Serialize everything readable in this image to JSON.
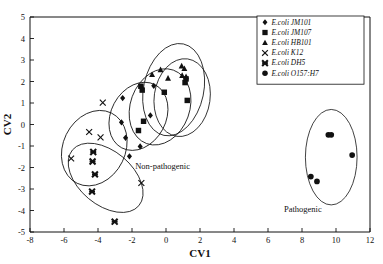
{
  "chart_data": {
    "type": "scatter",
    "title": "",
    "xlabel": "CV1",
    "ylabel": "CV2",
    "xlim": [
      -8,
      12
    ],
    "ylim": [
      -5,
      5
    ],
    "xticks": [
      -8,
      -6,
      -4,
      -2,
      0,
      2,
      4,
      6,
      8,
      10,
      12
    ],
    "yticks": [
      -5,
      -4,
      -3,
      -2,
      -1,
      0,
      1,
      2,
      3,
      4,
      5
    ],
    "grid": false,
    "legend_position": "top-right",
    "annotations": [
      {
        "text": "Non-pathogenic",
        "x": -0.2,
        "y": -2.05
      },
      {
        "text": "Pathogenic",
        "x": 8.05,
        "y": -4.05
      }
    ],
    "series": [
      {
        "name": "E.coli JM101",
        "marker": "diamond",
        "points": [
          {
            "x": -2.55,
            "y": 1.23
          },
          {
            "x": -2.62,
            "y": 0.1
          },
          {
            "x": -2.38,
            "y": -0.62
          },
          {
            "x": -2.15,
            "y": -1.48
          },
          {
            "x": -1.52,
            "y": -1.02
          },
          {
            "x": -0.92,
            "y": 0.42
          },
          {
            "x": -0.72,
            "y": 1.8
          }
        ]
      },
      {
        "name": "E.coli JM107",
        "marker": "square",
        "points": [
          {
            "x": -1.48,
            "y": 1.78
          },
          {
            "x": -1.4,
            "y": 1.6
          },
          {
            "x": -1.32,
            "y": 0.15
          },
          {
            "x": -1.62,
            "y": -0.28
          },
          {
            "x": -0.1,
            "y": 1.5
          },
          {
            "x": 1.12,
            "y": 1.95
          },
          {
            "x": 1.18,
            "y": 2.12
          },
          {
            "x": 1.25,
            "y": 1.12
          }
        ]
      },
      {
        "name": "E.coli HB101",
        "marker": "triangle",
        "points": [
          {
            "x": -0.82,
            "y": 2.32
          },
          {
            "x": -0.32,
            "y": 2.55
          },
          {
            "x": 0.12,
            "y": 2.15
          },
          {
            "x": 0.92,
            "y": 2.72
          },
          {
            "x": 1.08,
            "y": 2.6
          },
          {
            "x": 0.95,
            "y": 2.28
          },
          {
            "x": 1.18,
            "y": 2.22
          }
        ]
      },
      {
        "name": "E.coli K12",
        "marker": "x-thin",
        "points": [
          {
            "x": -3.72,
            "y": 1.02
          },
          {
            "x": -4.52,
            "y": -0.35
          },
          {
            "x": -3.85,
            "y": -0.6
          },
          {
            "x": -5.58,
            "y": -1.58
          },
          {
            "x": -1.45,
            "y": -2.72
          }
        ]
      },
      {
        "name": "E.coli DH5",
        "marker": "x-bold",
        "points": [
          {
            "x": -4.28,
            "y": -1.28
          },
          {
            "x": -4.32,
            "y": -1.72
          },
          {
            "x": -4.18,
            "y": -2.32
          },
          {
            "x": -4.35,
            "y": -3.12
          },
          {
            "x": -3.02,
            "y": -4.52
          }
        ]
      },
      {
        "name": "E.coli O157:H7",
        "marker": "circle",
        "points": [
          {
            "x": 9.55,
            "y": -0.48
          },
          {
            "x": 9.72,
            "y": -0.48
          },
          {
            "x": 10.95,
            "y": -1.42
          },
          {
            "x": 8.52,
            "y": -2.42
          },
          {
            "x": 8.88,
            "y": -2.65
          }
        ]
      }
    ],
    "ellipses": [
      {
        "name": "jm101-ellipse",
        "cx": -1.62,
        "cy": 0.38,
        "rx": 2.1,
        "ry": 1.28,
        "rot": -62
      },
      {
        "name": "jm107-ellipse",
        "cx": -0.35,
        "cy": 0.82,
        "rx": 2.3,
        "ry": 1.38,
        "rot": -70
      },
      {
        "name": "hb101-ellipse",
        "cx": 0.45,
        "cy": 1.62,
        "rx": 2.75,
        "ry": 1.4,
        "rot": -78
      },
      {
        "name": "hb101b-ellipse",
        "cx": 0.95,
        "cy": 1.25,
        "rx": 2.3,
        "ry": 1.3,
        "rot": -82
      },
      {
        "name": "k12-ellipse",
        "cx": -4.22,
        "cy": -1.1,
        "rx": 2.3,
        "ry": 1.45,
        "rot": -64
      },
      {
        "name": "dh5-ellipse",
        "cx": -3.55,
        "cy": -2.48,
        "rx": 2.55,
        "ry": 1.25,
        "rot": 40
      },
      {
        "name": "pathogenic-ellipse",
        "cx": 9.72,
        "cy": -1.52,
        "rx": 1.52,
        "ry": 2.22,
        "rot": 0
      }
    ]
  },
  "legend": {
    "items": [
      {
        "label": "E.coli JM101",
        "marker": "diamond"
      },
      {
        "label": "E.coli JM107",
        "marker": "square"
      },
      {
        "label": "E.coli HB101",
        "marker": "triangle"
      },
      {
        "label": "E.coli K12",
        "marker": "x-thin"
      },
      {
        "label": "E.coli DH5",
        "marker": "x-bold"
      },
      {
        "label": "E.coli O157:H7",
        "marker": "circle"
      }
    ]
  }
}
